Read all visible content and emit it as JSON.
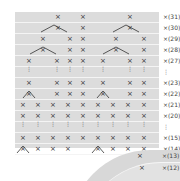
{
  "chart_title": "",
  "colors": {
    "background": "#ffffff",
    "grid_fill": "#dcdcdc",
    "row_line": "#f4f4f4",
    "symbol": "#333333"
  },
  "symbols": {
    "single_crochet": "×",
    "row_prefix": "×",
    "vertical_dots": "⋮"
  },
  "rows": [
    {
      "label": "×(31)"
    },
    {
      "label": "×(30)"
    },
    {
      "label": "×(29)"
    },
    {
      "label": "×(28)"
    },
    {
      "label": "×(27)"
    },
    {
      "label": "⋮"
    },
    {
      "label": "×(23)"
    },
    {
      "label": "×(22)"
    },
    {
      "label": "×(21)"
    },
    {
      "label": "×(20)"
    },
    {
      "label": "⋮"
    },
    {
      "label": "×(15)"
    },
    {
      "label": "×(14)"
    }
  ],
  "curved_rows": [
    {
      "label": "×(13)"
    },
    {
      "label": "×(12)"
    }
  ]
}
